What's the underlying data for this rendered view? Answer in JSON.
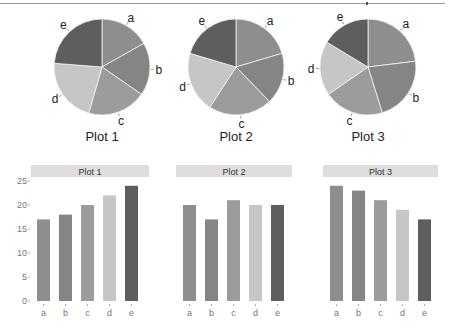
{
  "colors": {
    "a": "#8e8e8e",
    "b": "#858585",
    "c": "#9c9c9c",
    "d": "#c6c6c6",
    "e": "#5e5e5e",
    "strip": "#dedede",
    "tick": "#777777"
  },
  "chart_data": [
    {
      "type": "pie",
      "title": "Plot 1",
      "categories": [
        "a",
        "b",
        "c",
        "d",
        "e"
      ],
      "values": [
        17,
        18,
        20,
        22,
        24
      ],
      "start": "12 o'clock, clockwise"
    },
    {
      "type": "pie",
      "title": "Plot 2",
      "categories": [
        "a",
        "b",
        "c",
        "d",
        "e"
      ],
      "values": [
        20,
        17,
        21,
        20,
        20
      ],
      "start": "12 o'clock, clockwise"
    },
    {
      "type": "pie",
      "title": "Plot 3",
      "categories": [
        "a",
        "b",
        "c",
        "d",
        "e"
      ],
      "values": [
        24,
        23,
        21,
        19,
        17
      ],
      "start": "12 o'clock, clockwise"
    },
    {
      "type": "bar",
      "title": "Plot 1",
      "categories": [
        "a",
        "b",
        "c",
        "d",
        "e"
      ],
      "values": [
        17,
        18,
        20,
        22,
        24
      ],
      "yticks": [
        0,
        5,
        10,
        15,
        20,
        25
      ],
      "ylim": [
        0,
        25
      ],
      "grid": false
    },
    {
      "type": "bar",
      "title": "Plot 2",
      "categories": [
        "a",
        "b",
        "c",
        "d",
        "e"
      ],
      "values": [
        20,
        17,
        21,
        20,
        20
      ],
      "ylim": [
        0,
        25
      ],
      "grid": false
    },
    {
      "type": "bar",
      "title": "Plot 3",
      "categories": [
        "a",
        "b",
        "c",
        "d",
        "e"
      ],
      "values": [
        24,
        23,
        21,
        19,
        17
      ],
      "ylim": [
        0,
        25
      ],
      "grid": false
    }
  ]
}
